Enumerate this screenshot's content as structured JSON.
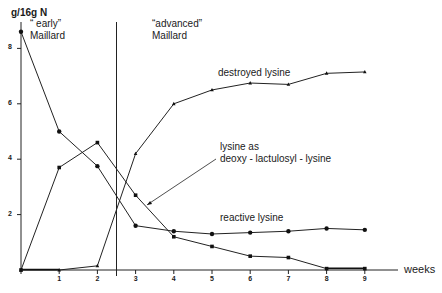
{
  "chart_data": {
    "type": "line",
    "title": "",
    "xlabel": "weeks",
    "ylabel": "g/16g N",
    "x": [
      0,
      1,
      2,
      3,
      4,
      5,
      6,
      7,
      8,
      9
    ],
    "x_ticks": [
      "1",
      "2",
      "3",
      "4",
      "5",
      "6",
      "7",
      "8",
      "9"
    ],
    "y_ticks": [
      "2",
      "4",
      "6",
      "8"
    ],
    "xlim": [
      0,
      9.5
    ],
    "ylim": [
      0,
      9
    ],
    "grid": false,
    "legend": "inline annotations",
    "series": [
      {
        "name": "reactive lysine",
        "marker": "circle",
        "values": [
          8.6,
          5.0,
          3.75,
          1.6,
          1.4,
          1.3,
          1.35,
          1.4,
          1.5,
          1.45
        ]
      },
      {
        "name": "lysine as deoxy-lactulosyl-lysine",
        "marker": "square",
        "values": [
          0.0,
          3.7,
          4.6,
          2.7,
          1.2,
          0.85,
          0.5,
          0.45,
          0.05,
          0.05
        ]
      },
      {
        "name": "destroyed lysine",
        "marker": "triangle",
        "values": [
          0.0,
          0.0,
          0.15,
          4.2,
          6.0,
          6.5,
          6.75,
          6.7,
          7.1,
          7.15
        ]
      }
    ],
    "annotations": [
      {
        "text": "\"early\" Maillard",
        "region": "0-2.5 weeks"
      },
      {
        "text": "\"advanced\" Maillard",
        "region": "2.5-9 weeks"
      },
      {
        "text": "destroyed lysine"
      },
      {
        "text": "lysine as deoxy - lactulosyl - lysine"
      },
      {
        "text": "reactive lysine"
      }
    ],
    "divider_x": 2.5
  },
  "labels": {
    "y_unit": "g/16g N",
    "x_unit": "weeks",
    "early_line1": "“ early”",
    "early_line2": "Maillard",
    "advanced_line1": "“advanced”",
    "advanced_line2": "Maillard",
    "destroyed": "destroyed  lysine",
    "lactulosyl_line1": "lysine  as",
    "lactulosyl_line2": "deoxy - lactulosyl - lysine",
    "reactive": "reactive  lysine"
  }
}
